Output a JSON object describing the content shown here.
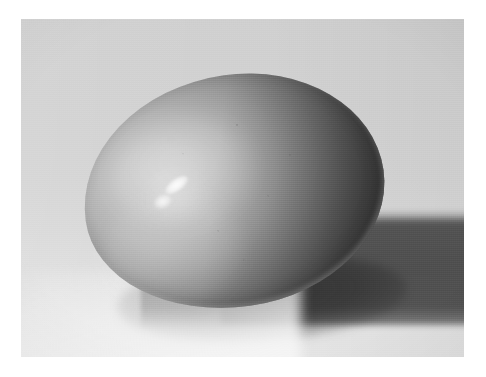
{
  "page": {
    "type": "photograph",
    "orientation": "landscape",
    "width_px": 486,
    "height_px": 377,
    "page_background_color": "#ffffff",
    "margin_px": 21,
    "caption": "",
    "text_content": []
  },
  "photo": {
    "frame": {
      "left_px": 21,
      "top_px": 19,
      "width_px": 443,
      "height_px": 338
    },
    "color_mode": "grayscale",
    "border_color": "#ffffff",
    "backdrop": {
      "label": "seamless studio backdrop",
      "top_color": "#d0d0d0",
      "mid_color": "#d5d5d5",
      "bottom_color": "#e6e6e6"
    },
    "lighting": {
      "key_light_direction": "upper-left",
      "specular_highlight_position": "upper-left of subject",
      "terminator_side": "right"
    }
  },
  "subject": {
    "name": "egg",
    "shape": "ellipsoid",
    "center_px": {
      "x": 233,
      "y": 190
    },
    "width_px": 302,
    "height_px": 232,
    "tilt_degrees": -8,
    "lit_side_color": "#cfcfcf",
    "midtone_color": "#a0a0a0",
    "shadow_side_color": "#4a4a4a",
    "highlight_color": "#ffffff"
  },
  "shadow": {
    "name": "cast shadow",
    "direction": "right",
    "band_top_px": 218,
    "band_bottom_px": 325,
    "extends_to": "right edge of photo",
    "shadow_color": "#6a6a6a",
    "contact_shadow_color": "#5a5a5a"
  }
}
